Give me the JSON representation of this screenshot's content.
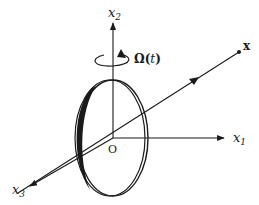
{
  "diagram": {
    "type": "3d-coordinate-figure",
    "colors": {
      "stroke": "#1a1a1a",
      "background": "#ffffff"
    },
    "labels": {
      "x1": "x",
      "x1_sub": "1",
      "x2": "x",
      "x2_sub": "2",
      "x3": "x",
      "x3_sub": "3",
      "origin": "O",
      "point": "x",
      "omega": "Ω(",
      "omega_t": "t",
      "omega_close": ")"
    },
    "axes": [
      {
        "name": "x1",
        "from": [
          113,
          138
        ],
        "to": [
          225,
          138
        ]
      },
      {
        "name": "x2",
        "from": [
          113,
          138
        ],
        "to": [
          113,
          22
        ]
      },
      {
        "name": "x3",
        "from": [
          113,
          138
        ],
        "to": [
          28,
          187
        ]
      }
    ],
    "vector": {
      "name": "x",
      "from": [
        18,
        193
      ],
      "to": [
        239,
        52
      ]
    },
    "disk": {
      "cx": 113,
      "cy": 138,
      "rx": 36,
      "ry": 58
    }
  }
}
